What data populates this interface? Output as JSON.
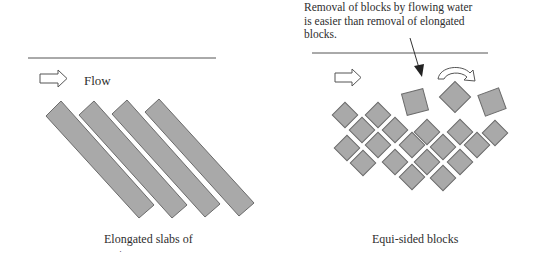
{
  "left_panel": {
    "flow_label": "Flow",
    "caption": "Elongated slabs of",
    "caption_continuation": "·",
    "slab_count": 4
  },
  "right_panel": {
    "annotation": "Removal of blocks by flowing water is easier than removal of elongated blocks.",
    "caption": "Equi-sided blocks",
    "dislodged_block_count": 3,
    "packed_block_count": 19
  },
  "colors": {
    "block_fill": "#a9a9a9",
    "block_stroke": "#6b6b6b",
    "line": "#444444",
    "text": "#2e2e2e"
  }
}
